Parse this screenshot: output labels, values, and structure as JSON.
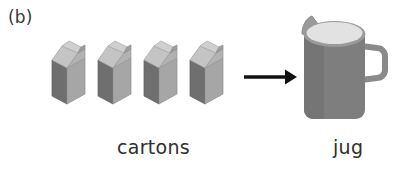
{
  "figure": {
    "panel_label": "(b)",
    "type": "illustration-diagram",
    "background_color": "#ffffff"
  },
  "left_group": {
    "name": "cartons",
    "caption": "cartons",
    "count": 4,
    "item_icon": "milk-carton-icon",
    "items": [
      {
        "label": "carton-1"
      },
      {
        "label": "carton-2"
      },
      {
        "label": "carton-3"
      },
      {
        "label": "carton-4"
      }
    ],
    "colors": {
      "front_dark_face": "#6f6f6f",
      "side_light_face": "#a6a6a6",
      "gable_top_light": "#c9c9c9",
      "gable_top_mid": "#b4b4b4",
      "gable_ridge": "#8e8e8e",
      "outline": "#8a8a8a"
    }
  },
  "connector": {
    "name": "arrow",
    "icon": "arrow-right-icon",
    "direction": "right",
    "color": "#111111"
  },
  "right_group": {
    "name": "jug",
    "caption": "jug",
    "item_icon": "jug-icon",
    "colors": {
      "body": "#7e7e7e",
      "body_shade": "#737373",
      "milk_surface": "#e2e2e2",
      "rim": "#9a9a9a",
      "handle": "#8a8a8a",
      "outline": "#6a6a6a"
    }
  }
}
